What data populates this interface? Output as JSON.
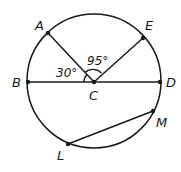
{
  "diagram": {
    "type": "circle-geometry",
    "circle": {
      "center_label": "C",
      "cx": 94,
      "cy": 81,
      "r": 67
    },
    "points": [
      {
        "name": "A",
        "label": "A",
        "x": 48,
        "y": 33,
        "lx": 35,
        "ly": 30
      },
      {
        "name": "E",
        "label": "E",
        "x": 143,
        "y": 38,
        "lx": 145,
        "ly": 30
      },
      {
        "name": "B",
        "label": "B",
        "x": 28,
        "y": 82,
        "lx": 12,
        "ly": 87
      },
      {
        "name": "D",
        "label": "D",
        "x": 160,
        "y": 82,
        "lx": 166,
        "ly": 87
      },
      {
        "name": "C",
        "label": "C",
        "x": 94,
        "y": 82,
        "lx": 89,
        "ly": 100
      },
      {
        "name": "M",
        "label": "M",
        "x": 153,
        "y": 111,
        "lx": 156,
        "ly": 127
      },
      {
        "name": "L",
        "label": "L",
        "x": 68,
        "y": 144,
        "lx": 57,
        "ly": 160
      }
    ],
    "segments": [
      {
        "name": "diameter-BD",
        "from": "B",
        "to": "D"
      },
      {
        "name": "radius-CA",
        "from": "C",
        "to": "A"
      },
      {
        "name": "radius-CE",
        "from": "C",
        "to": "E"
      },
      {
        "name": "chord-LM",
        "from": "L",
        "to": "M"
      }
    ],
    "angles": [
      {
        "name": "angle-BCA",
        "label": "30°",
        "lx": 56,
        "ly": 77
      },
      {
        "name": "angle-ACE",
        "label": "95°",
        "lx": 87,
        "ly": 65
      }
    ]
  }
}
